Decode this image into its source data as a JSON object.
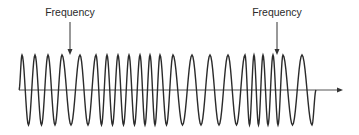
{
  "diagram": {
    "type": "frequency-modulated-wave",
    "labels": [
      {
        "text": "Frequency",
        "x": 70,
        "y": 6,
        "arrow": {
          "x": 70,
          "y1": 22,
          "y2": 55
        }
      },
      {
        "text": "Frequency",
        "x": 277,
        "y": 6,
        "arrow": {
          "x": 277,
          "y1": 22,
          "y2": 55
        }
      }
    ],
    "axis": {
      "x1": 19,
      "x2": 343,
      "y": 90,
      "color": "#555555"
    },
    "wave": {
      "color": "#2b2b2b",
      "baseline": 90,
      "amplitude": 35,
      "start_x": 19,
      "end_x": 316,
      "peaks_x": [
        22,
        35,
        48,
        62,
        80,
        96,
        107,
        118,
        129,
        140,
        150,
        160,
        173,
        192,
        210,
        228,
        245,
        254,
        263,
        273,
        283,
        302
      ],
      "final_trough_x": 312
    }
  }
}
